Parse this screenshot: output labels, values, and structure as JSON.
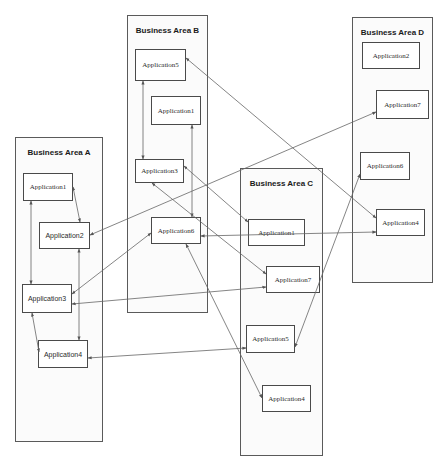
{
  "areas": {
    "a": {
      "title": "Business Area A",
      "apps": [
        "Application1",
        "Application2",
        "Application3",
        "Application4"
      ]
    },
    "b": {
      "title": "Business Area B",
      "apps": [
        "Application5",
        "Application1",
        "Application3",
        "Application6"
      ]
    },
    "c": {
      "title": "Business Area C",
      "apps": [
        "Application1",
        "Application7",
        "Application5",
        "Application4"
      ]
    },
    "d": {
      "title": "Business Area D",
      "apps": [
        "Application2",
        "Application7",
        "Application6",
        "Application4"
      ]
    }
  },
  "connections": [
    {
      "from": "A.Application1",
      "to": "A.Application2",
      "bidirectional": true
    },
    {
      "from": "A.Application1",
      "to": "A.Application3",
      "bidirectional": true
    },
    {
      "from": "A.Application2",
      "to": "A.Application4",
      "bidirectional": true
    },
    {
      "from": "A.Application3",
      "to": "A.Application4",
      "bidirectional": true
    },
    {
      "from": "A.Application2",
      "to": "D.Application7",
      "bidirectional": true
    },
    {
      "from": "A.Application3",
      "to": "B.Application6",
      "bidirectional": true
    },
    {
      "from": "A.Application3",
      "to": "C.Application7",
      "bidirectional": true
    },
    {
      "from": "A.Application4",
      "to": "C.Application5",
      "bidirectional": true
    },
    {
      "from": "B.Application5",
      "to": "B.Application3",
      "bidirectional": true
    },
    {
      "from": "B.Application1",
      "to": "B.Application6",
      "bidirectional": true
    },
    {
      "from": "B.Application5",
      "to": "D.Application4",
      "bidirectional": true
    },
    {
      "from": "B.Application3",
      "to": "C.Application1",
      "bidirectional": true
    },
    {
      "from": "B.Application3",
      "to": "C.Application7",
      "bidirectional": true
    },
    {
      "from": "B.Application6",
      "to": "D.Application4",
      "bidirectional": true
    },
    {
      "from": "B.Application6",
      "to": "C.Application4",
      "bidirectional": true
    },
    {
      "from": "C.Application5",
      "to": "D.Application6",
      "bidirectional": true
    }
  ]
}
